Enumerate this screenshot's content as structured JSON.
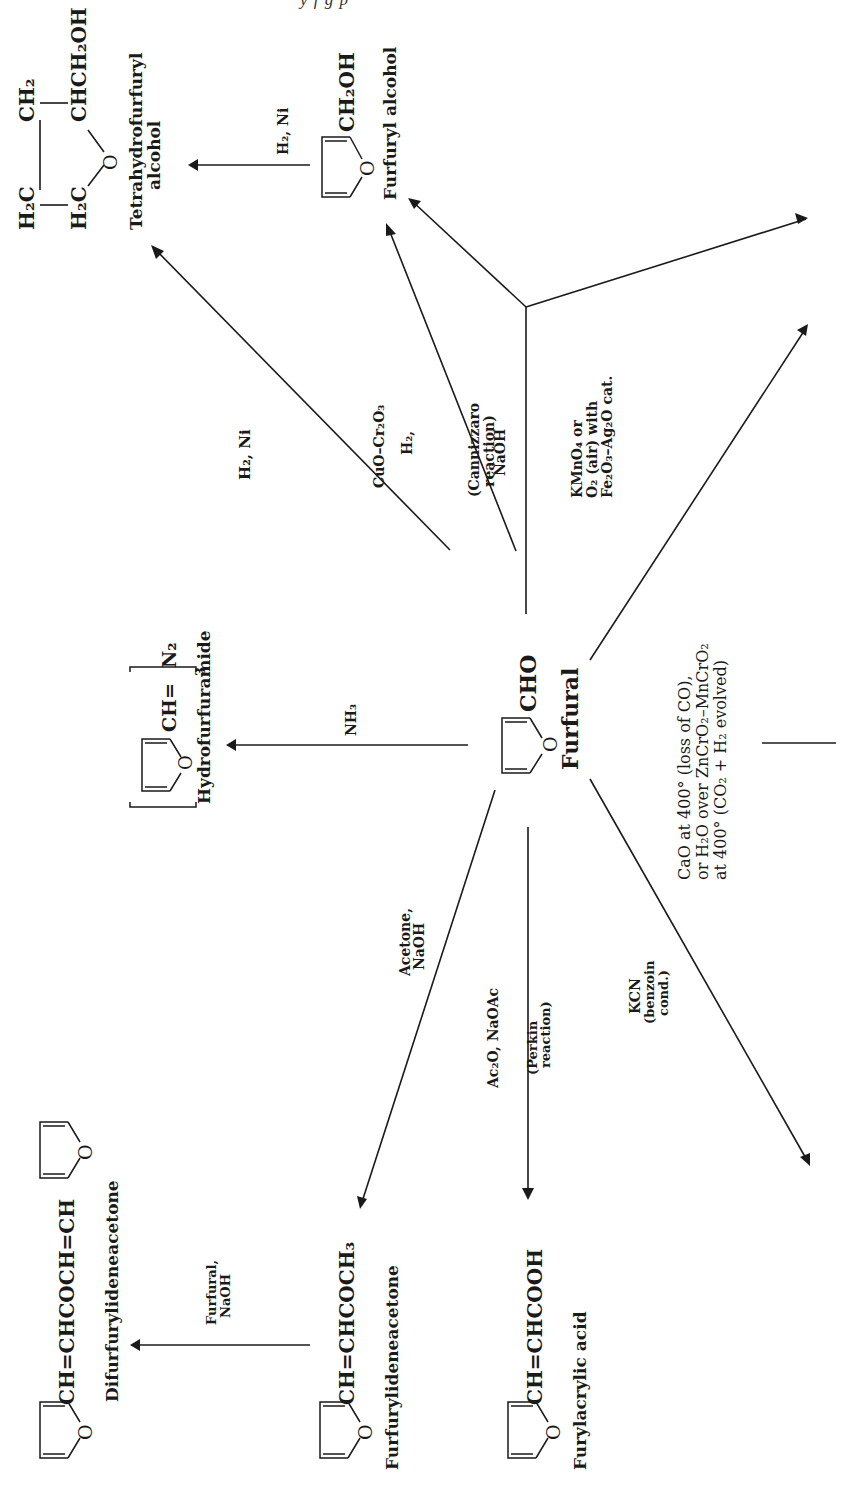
{
  "page": {
    "header_fragment": "y  f  g   p"
  },
  "center": {
    "name": "Furfural",
    "formula": "CHO",
    "ring_o": "O"
  },
  "compounds": {
    "thfa": {
      "name_line1": "Tetrahydrofurfuryl",
      "name_line2": "alcohol",
      "f_h2c_top": "H₂C",
      "f_ch2": "CH₂",
      "f_h2c_bot": "H₂C",
      "f_chch2oh": "CHCH₂OH",
      "f_o": "O"
    },
    "furfuryl_alcohol": {
      "name": "Furfuryl alcohol",
      "formula": "CH₂OH",
      "ring_o": "O"
    },
    "hydrofurfuramide": {
      "name": "Hydrofurfuramide",
      "formula": "CH=",
      "suffix": "N₂",
      "subscript": "3",
      "ring_o": "O"
    },
    "difurfurylideneacetone": {
      "name": "Difurfurylideneacetone",
      "formula": "CH=CHCOCH=CH",
      "ring_o": "O"
    },
    "furfurylideneacetone": {
      "name": "Furfurylideneacetone",
      "formula": "CH=CHCOCH₃",
      "ring_o": "O"
    },
    "furylacrylic_acid": {
      "name": "Furylacrylic acid",
      "formula": "CH=CHCOOH",
      "ring_o": "O"
    }
  },
  "reactions": {
    "h2ni_to_thfa": {
      "label": "H₂, Ni"
    },
    "h2ni_fa_to_thfa": {
      "label": "H₂, Ni"
    },
    "h2_cuo": {
      "line1": "H₂,",
      "line2": "CuO–Cr₂O₃"
    },
    "naoh_cannizzaro": {
      "line1": "NaOH",
      "line2": "(Cannizzaro",
      "line3": "reaction)"
    },
    "oxidation": {
      "line1": "KMnO₄ or",
      "line2": "O₂  (air)  with",
      "line3": "Fe₂O₃–Ag₂O cat."
    },
    "nh3": {
      "label": "NH₃"
    },
    "decarbonylation": {
      "line1": "CaO  at  400°  (loss of CO),",
      "line2": "or H₂O over ZnCrO₂–MnCrO₂",
      "line3": "at  400°  (CO₂ + H₂ evolved)"
    },
    "acetone": {
      "line1": "Acetone,",
      "line2": "NaOH"
    },
    "perkin": {
      "line1": "Ac₂O, NaOAc",
      "line2": "(Perkin",
      "line3": "reaction)"
    },
    "kcn": {
      "line1": "KCN",
      "line2": "(benzoin",
      "line3": "cond.)"
    },
    "furfural_naoh": {
      "line1": "Furfural,",
      "line2": "NaOH"
    }
  },
  "colors": {
    "ink": "#1a1a1a",
    "paper": "#ffffff"
  }
}
